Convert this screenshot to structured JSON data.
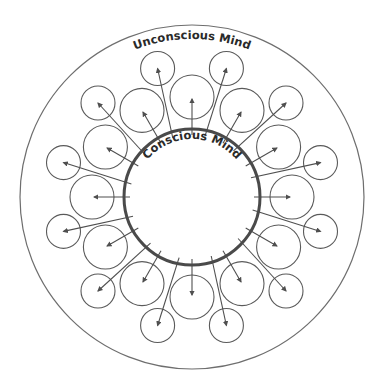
{
  "diagram": {
    "outer_label": "Unconscious Mind",
    "inner_label": "Conscious Mind",
    "colors": {
      "background": "#ffffff",
      "outer_circle": "#6e6e6e",
      "inner_circle": "#4a4a4a",
      "bubble": "#5a5a5a",
      "arrow": "#4f4f4f",
      "text": "#2a2a2a"
    },
    "geometry": {
      "center": [
        192,
        197
      ],
      "outer_radius": 172,
      "inner_radius": 68,
      "large_bubble_count": 12,
      "large_bubble_ring_radius": 100,
      "large_bubble_radius": 22,
      "small_bubble_count": 12,
      "small_bubble_ring_radius": 133,
      "small_bubble_radius": 17,
      "small_bubble_angle_offset_deg": 15
    }
  }
}
